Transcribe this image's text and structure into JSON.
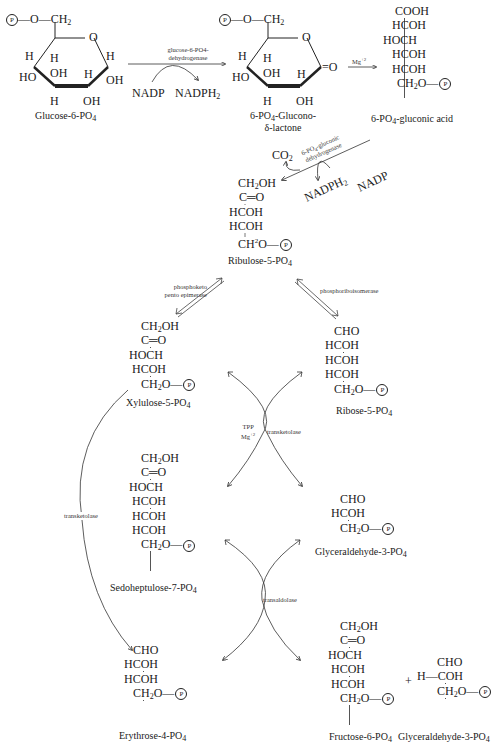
{
  "title_fragment": "…y",
  "phosphate_symbol": "P",
  "compounds": {
    "glucose6p": {
      "name": "Glucose-6-PO4",
      "name_main": "Glucose-6-PO",
      "name_sub": "4",
      "top_group": "P—O—CH2",
      "ring_labels": [
        "O",
        "H",
        "H",
        "H",
        "HO",
        "OH",
        "H",
        "OH",
        "H",
        "OH"
      ]
    },
    "gluconolactone": {
      "name_line1": "6-PO4-Glucono-",
      "name_line2": "δ-lactone",
      "ring_labels": [
        "O",
        "H",
        "H",
        "HO",
        "OH",
        "H",
        "H",
        "OH",
        "=O"
      ]
    },
    "gluconic_acid": {
      "name": "6-PO4-gluconic acid",
      "rows": [
        "COOH",
        "HCOH",
        "HOCH",
        "HCOH",
        "HCOH",
        "CH2O—P"
      ]
    },
    "ribulose5p": {
      "name": "Ribulose-5-PO4",
      "rows": [
        "CH2OH",
        "C═O",
        "HCOH",
        "HCOH",
        "CH2O—P"
      ]
    },
    "xylulose5p": {
      "name": "Xylulose-5-PO4",
      "rows": [
        "CH2OH",
        "C═O",
        "HOCH",
        "HCOH",
        "CH2O—P"
      ]
    },
    "ribose5p": {
      "name": "Ribose-5-PO4",
      "rows": [
        "CHO",
        "HCOH",
        "HCOH",
        "HCOH",
        "CH2O—P"
      ]
    },
    "sedoheptulose7p": {
      "name": "Sedoheptulose-7-PO4",
      "rows": [
        "CH2OH",
        "C═O",
        "HOCH",
        "HCOH",
        "HCOH",
        "HCOH",
        "CH2O—P"
      ]
    },
    "glyceraldehyde3p_a": {
      "name": "Glyceraldehyde-3-PO4",
      "rows": [
        "CHO",
        "HCOH",
        "CH2O—P"
      ]
    },
    "erythrose4p": {
      "name": "Erythrose-4-PO4",
      "rows": [
        "CHO",
        "HCOH",
        "HCOH",
        "CH2O—P"
      ]
    },
    "fructose6p": {
      "name": "Fructose-6-PO4",
      "rows": [
        "CH2OH",
        "C═O",
        "HOCH",
        "HCOH",
        "HCOH",
        "CH2O—P"
      ]
    },
    "glyceraldehyde3p_b": {
      "name": "Glyceraldehyde-3-PO4",
      "plus": "+",
      "rows": [
        "CHO",
        "H—COH",
        "CH2O—P"
      ]
    }
  },
  "enzymes": {
    "g6pdh_line1": "glucose-6-PO4-",
    "g6pdh_line2": "dehydrogenase",
    "mg": "Mg+2",
    "pgd_line1": "6-PO4-gluconic",
    "pgd_line2": "dehydrogenase",
    "epimerase_line1": "phosphoketo",
    "epimerase_line2": "pento epimerase",
    "isomerase": "phosphoriboisomerase",
    "tpp": "TPP",
    "tpp_mg": "Mg+2",
    "transketolase_center": "transketolase",
    "transketolase_left": "transketolase",
    "transaldolase": "transaldolase"
  },
  "cofactors": {
    "nadp_1": "NADP",
    "nadph_1": "NADPH2",
    "co2": "CO2",
    "nadph_2": "NADPH2",
    "nadp_2": "NADP"
  }
}
